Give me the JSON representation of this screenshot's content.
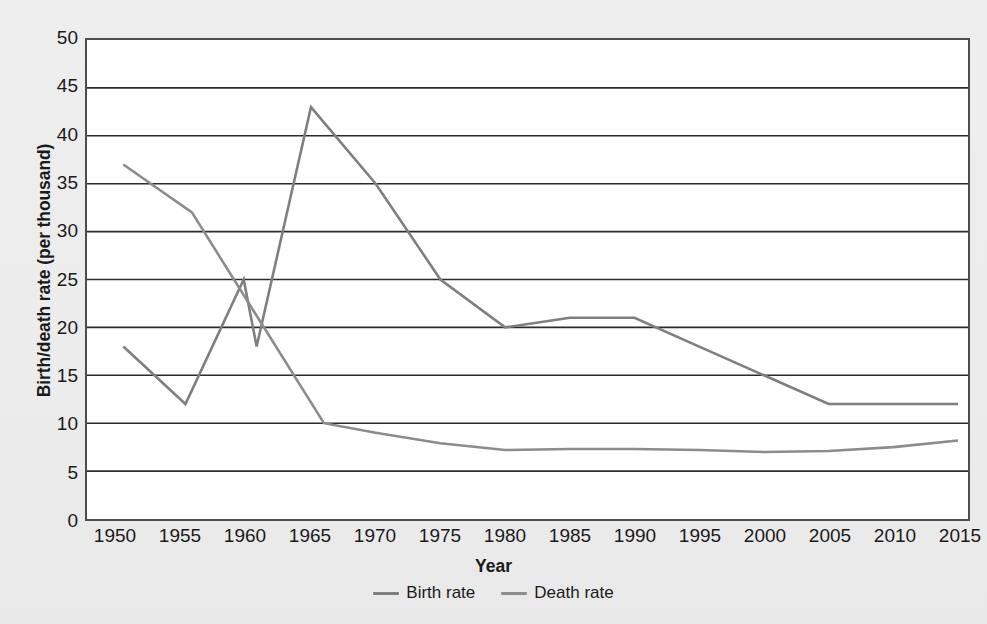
{
  "chart_data": {
    "type": "line",
    "title": "",
    "xlabel": "Year",
    "ylabel": "Birth/death rate (per thousand)",
    "xlim": [
      1950,
      2015
    ],
    "ylim": [
      0,
      50
    ],
    "ytick_step": 5,
    "grid": true,
    "legend_position": "bottom",
    "xticks": [
      "1950",
      "1955",
      "1960",
      "1965",
      "1970",
      "1975",
      "1980",
      "1985",
      "1990",
      "1995",
      "2000",
      "2005",
      "2010",
      "2015"
    ],
    "yticks": [
      "0",
      "5",
      "10",
      "15",
      "20",
      "25",
      "30",
      "35",
      "40",
      "45",
      "50"
    ],
    "series": [
      {
        "name": "Birth rate",
        "color": "#7f7f7f",
        "points": [
          {
            "x": 1950.5,
            "y": 18
          },
          {
            "x": 1955.3,
            "y": 12
          },
          {
            "x": 1959.8,
            "y": 25
          },
          {
            "x": 1960.8,
            "y": 18
          },
          {
            "x": 1965.0,
            "y": 43
          },
          {
            "x": 1970.0,
            "y": 35
          },
          {
            "x": 1975.0,
            "y": 25
          },
          {
            "x": 1980.0,
            "y": 20
          },
          {
            "x": 1985.0,
            "y": 21
          },
          {
            "x": 1990.0,
            "y": 21
          },
          {
            "x": 1995.0,
            "y": 18
          },
          {
            "x": 2000.0,
            "y": 15
          },
          {
            "x": 2005.0,
            "y": 12
          },
          {
            "x": 2010.0,
            "y": 12
          },
          {
            "x": 2015.0,
            "y": 12
          }
        ]
      },
      {
        "name": "Death rate",
        "color": "#8c8c8c",
        "points": [
          {
            "x": 1950.5,
            "y": 37
          },
          {
            "x": 1955.8,
            "y": 32
          },
          {
            "x": 1966.0,
            "y": 10
          },
          {
            "x": 1970.0,
            "y": 9.0
          },
          {
            "x": 1975.0,
            "y": 7.9
          },
          {
            "x": 1980.0,
            "y": 7.2
          },
          {
            "x": 1985.0,
            "y": 7.3
          },
          {
            "x": 1990.0,
            "y": 7.3
          },
          {
            "x": 1995.0,
            "y": 7.2
          },
          {
            "x": 2000.0,
            "y": 7.0
          },
          {
            "x": 2005.0,
            "y": 7.1
          },
          {
            "x": 2010.0,
            "y": 7.5
          },
          {
            "x": 2015.0,
            "y": 8.2
          }
        ]
      }
    ]
  },
  "legend": {
    "items": [
      {
        "label": "Birth rate"
      },
      {
        "label": "Death rate"
      }
    ]
  },
  "colors": {
    "background": "#eeeeee",
    "plot_background": "#ffffff",
    "axis": "#4d4d4d",
    "gridline": "#2b2b2b",
    "birth_rate": "#7f7f7f",
    "death_rate": "#8c8c8c",
    "text": "#1a1a1a"
  }
}
